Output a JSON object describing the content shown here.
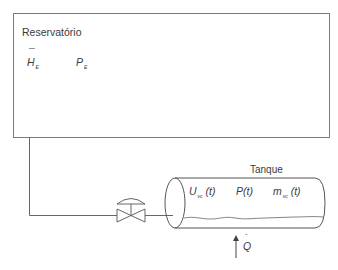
{
  "diagram": {
    "reservoir": {
      "title": "Reservatório",
      "vars": [
        {
          "symbol": "H",
          "overbar": "¯",
          "subscript": "E"
        },
        {
          "symbol": "P",
          "subscript": "E"
        }
      ]
    },
    "tank": {
      "title": "Tanque",
      "vars": [
        {
          "symbol": "U",
          "subscript": "vc",
          "arg": "(t)"
        },
        {
          "symbol": "P",
          "subscript": "",
          "arg": "(t)"
        },
        {
          "symbol": "m",
          "subscript": "vc",
          "arg": "(t)"
        }
      ]
    },
    "heat": {
      "symbol": "Q",
      "dot": "˙"
    },
    "valve": {
      "label": "valve"
    },
    "colors": {
      "line": "#555555",
      "text": "#3a3a3a"
    }
  }
}
